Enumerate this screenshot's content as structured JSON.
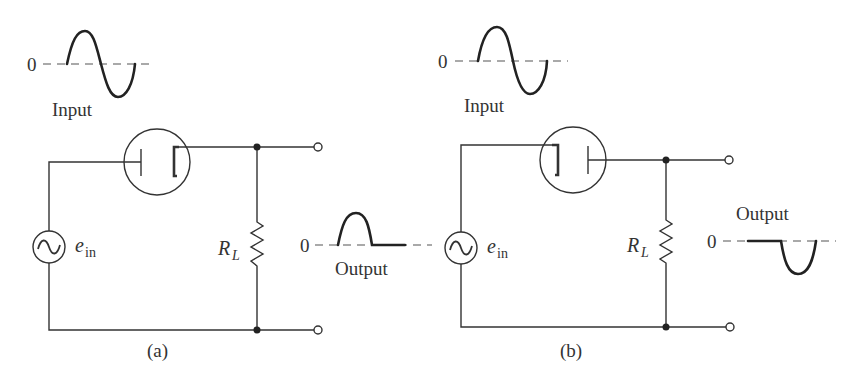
{
  "figure": {
    "panels": [
      {
        "id": "a",
        "caption": "(a)",
        "input_label": "Input",
        "input_zero": "0",
        "output_label": "Output",
        "output_zero": "0",
        "source_label": "e",
        "source_subscript": "in",
        "resistor_label": "R",
        "resistor_subscript": "L",
        "diode_orientation": "anode-left (plate to source), cathode-right",
        "output_waveform": "positive half-wave"
      },
      {
        "id": "b",
        "caption": "(b)",
        "input_label": "Input",
        "input_zero": "0",
        "output_label": "Output",
        "output_zero": "0",
        "source_label": "e",
        "source_subscript": "in",
        "resistor_label": "R",
        "resistor_subscript": "L",
        "diode_orientation": "cathode-left (to source), plate-right",
        "output_waveform": "negative half-wave"
      }
    ],
    "colors": {
      "ink": "#333333",
      "background": "#ffffff"
    }
  }
}
